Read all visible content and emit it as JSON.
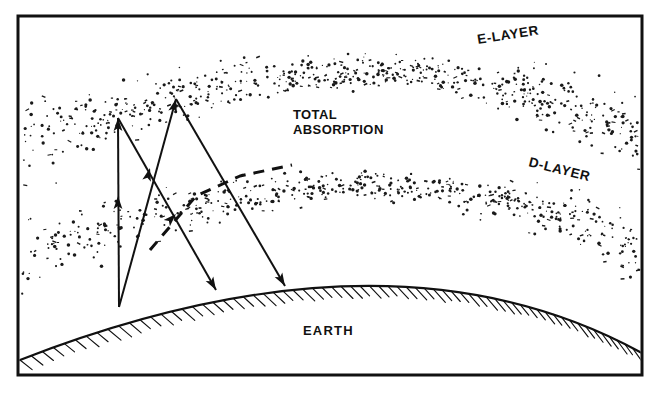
{
  "figure": {
    "domain_note": "scanned technical line drawing",
    "frame": {
      "x": 18,
      "y": 16,
      "width": 624,
      "height": 359,
      "stroke": "#111111",
      "stroke_width": 3,
      "fill": "#ffffff"
    },
    "background_color": "#ffffff",
    "ink_color": "#111111"
  },
  "labels": {
    "e_layer": "E-LAYER",
    "d_layer": "D-LAYER",
    "total_absorption_line1": "TOTAL",
    "total_absorption_line2": "ABSORPTION",
    "earth": "EARTH"
  },
  "label_positions": {
    "e_layer": {
      "x": 478,
      "y": 44,
      "rotate": -9
    },
    "d_layer": {
      "x": 528,
      "y": 166,
      "rotate": 14
    },
    "total_absorption": {
      "x": 293,
      "y": 119,
      "line_height": 15
    },
    "earth": {
      "x": 303,
      "y": 335
    }
  },
  "earth": {
    "label": "EARTH",
    "arc": {
      "left_x": 20,
      "left_y": 360,
      "apex_x": 360,
      "apex_y": 286,
      "right_x": 640,
      "right_y": 352
    },
    "hatch_count": 66,
    "hatch_length": 16,
    "hatch_color": "#111111"
  },
  "layers": [
    {
      "name": "E-LAYER",
      "id": "e-layer-band",
      "description": "upper ionospheric stipple band",
      "band_top_offset": -26,
      "band_bottom_offset": 26,
      "apex_y": 72,
      "dot_count": 620
    },
    {
      "name": "D-LAYER",
      "id": "d-layer-band",
      "description": "lower ionospheric stipple band",
      "band_top_offset": -22,
      "band_bottom_offset": 22,
      "apex_y": 186,
      "dot_count": 540
    }
  ],
  "transmitter": {
    "x": 119,
    "y": 307,
    "name": "transmitter-origin"
  },
  "rays": [
    {
      "name": "vertical-ray",
      "style": "solid",
      "points": [
        [
          119,
          307
        ],
        [
          118,
          118
        ]
      ],
      "arrowheads": [
        {
          "at": [
            118,
            118
          ],
          "angle": -90
        },
        {
          "at": [
            118,
            196
          ],
          "angle": -90
        }
      ],
      "note": "straight up, absorbed at E-layer"
    },
    {
      "name": "high-angle-ray-down",
      "style": "solid",
      "points": [
        [
          118,
          118
        ],
        [
          216,
          290
        ]
      ],
      "arrowheads": [
        {
          "at": [
            216,
            290
          ],
          "angle": 60
        }
      ],
      "note": "returns to earth near transmitter"
    },
    {
      "name": "second-ray-up",
      "style": "solid",
      "points": [
        [
          119,
          307
        ],
        [
          176,
          99
        ]
      ],
      "arrowheads": [
        {
          "at": [
            176,
            99
          ],
          "angle": -75
        },
        {
          "at": [
            150,
            168
          ],
          "angle": -75
        }
      ],
      "note": "second launch angle reaching upper band"
    },
    {
      "name": "second-ray-down",
      "style": "solid",
      "points": [
        [
          176,
          99
        ],
        [
          285,
          286
        ]
      ],
      "arrowheads": [
        {
          "at": [
            285,
            286
          ],
          "angle": 60
        }
      ],
      "note": "longer hop landing further along earth"
    },
    {
      "name": "escaping-ray-dashed",
      "style": "dashed",
      "points": [
        [
          150,
          250
        ],
        [
          196,
          196
        ],
        [
          240,
          176
        ],
        [
          292,
          165
        ]
      ],
      "arrowheads": [
        {
          "at": [
            176,
            214
          ],
          "angle": -45
        }
      ],
      "note": "low-angle ray refracted and escaping through the layer"
    }
  ],
  "caption": {
    "visible": false,
    "note": "figure caption is clipped by the bottom edge of the screenshot; only faint letter-tops are visible"
  },
  "colors": {
    "ink": "#111111",
    "paper": "#ffffff",
    "stipple": "#1a1a1a"
  }
}
